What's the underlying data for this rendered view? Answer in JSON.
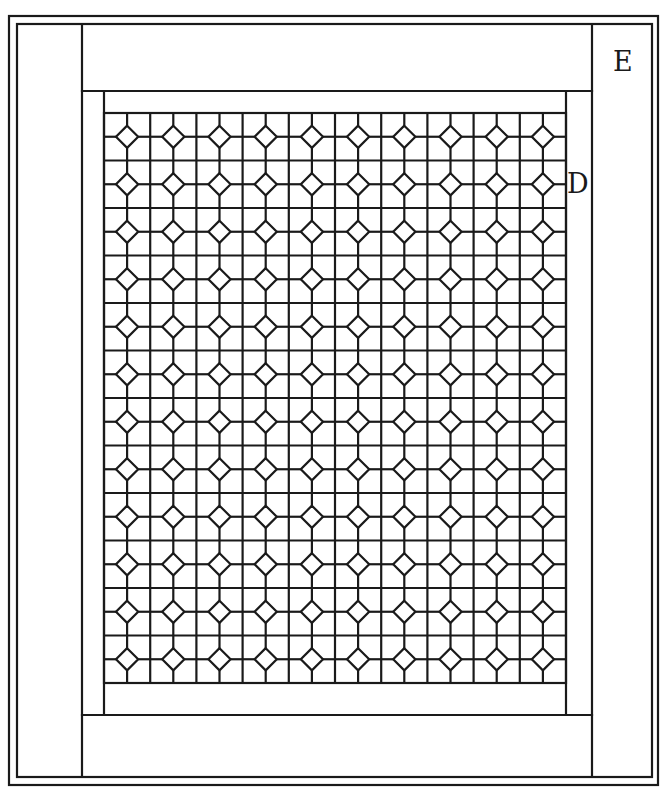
{
  "diagram": {
    "type": "quilt-layout",
    "labels": {
      "outer_border": "E",
      "inner_border": "D"
    },
    "colors": {
      "line": "#1a1a1a",
      "background": "#ffffff"
    },
    "grid": {
      "columns": 10,
      "rows": 12,
      "block_motif": "four-patch with center diamond"
    }
  }
}
